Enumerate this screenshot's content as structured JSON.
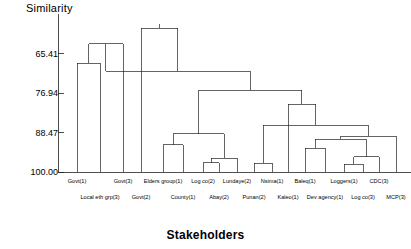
{
  "chart_data": {
    "type": "dendrogram",
    "title": "",
    "ylabel": "Similarity",
    "xlabel": "Stakeholders",
    "ytick_labels": [
      "65.41",
      "76.94",
      "88.47",
      "100.00"
    ],
    "ytick_values": [
      65.41,
      76.94,
      88.47,
      100.0
    ],
    "ylim": [
      100.0,
      53.88
    ],
    "axis_inverted": true,
    "grid": false,
    "legend": null,
    "leaves": [
      {
        "index": 0,
        "label": "Govt(1)",
        "row": 0,
        "x": 77
      },
      {
        "index": 1,
        "label": "Local eth grp(3)",
        "row": 1,
        "x": 100
      },
      {
        "index": 2,
        "label": "Govt(3)",
        "row": 0,
        "x": 123
      },
      {
        "index": 3,
        "label": "Govt(2)",
        "row": 1,
        "x": 141
      },
      {
        "index": 4,
        "label": "Elders group(1)",
        "row": 0,
        "x": 163
      },
      {
        "index": 5,
        "label": "County(1)",
        "row": 1,
        "x": 183
      },
      {
        "index": 6,
        "label": "Log co(2)",
        "row": 0,
        "x": 203
      },
      {
        "index": 7,
        "label": "Abay(2)",
        "row": 1,
        "x": 219
      },
      {
        "index": 8,
        "label": "Lundaye(2)",
        "row": 0,
        "x": 237
      },
      {
        "index": 9,
        "label": "Punan(2)",
        "row": 1,
        "x": 254
      },
      {
        "index": 10,
        "label": "Nsima(1)",
        "row": 0,
        "x": 272
      },
      {
        "index": 11,
        "label": "Kaleo(1)",
        "row": 1,
        "x": 288
      },
      {
        "index": 12,
        "label": "Baleq(1)",
        "row": 0,
        "x": 305
      },
      {
        "index": 13,
        "label": "Dev agency(1)",
        "row": 1,
        "x": 325
      },
      {
        "index": 14,
        "label": "Loggers(1)",
        "row": 0,
        "x": 344
      },
      {
        "index": 15,
        "label": "Log co(3)",
        "row": 1,
        "x": 363
      },
      {
        "index": 16,
        "label": "CDC(3)",
        "row": 0,
        "x": 379
      },
      {
        "index": 17,
        "label": "MCP(3)",
        "row": 1,
        "x": 396
      }
    ],
    "merges": [
      {
        "id": "m1",
        "left": 0,
        "right": 1,
        "similarity": 68.2
      },
      {
        "id": "m2",
        "left": "m1",
        "right": 2,
        "similarity": 62.5
      },
      {
        "id": "m3",
        "left": 6,
        "right": 7,
        "similarity": 97.3
      },
      {
        "id": "m4",
        "left": "m3",
        "right": 8,
        "similarity": 96.0
      },
      {
        "id": "m5",
        "left": 4,
        "right": 5,
        "similarity": 92.1
      },
      {
        "id": "m6",
        "left": "m5",
        "right": "m4",
        "similarity": 88.8
      },
      {
        "id": "m7",
        "left": 9,
        "right": 10,
        "similarity": 97.5
      },
      {
        "id": "m8",
        "left": 14,
        "right": 15,
        "similarity": 97.8
      },
      {
        "id": "m9",
        "left": "m8",
        "right": 16,
        "similarity": 95.5
      },
      {
        "id": "m10",
        "left": 12,
        "right": 13,
        "similarity": 93.0
      },
      {
        "id": "m11",
        "left": "m10",
        "right": "m9",
        "similarity": 90.5
      },
      {
        "id": "m12",
        "left": "m11",
        "right": 17,
        "similarity": 89.6
      },
      {
        "id": "m13",
        "left": "m7",
        "right": "m12",
        "similarity": 86.4
      },
      {
        "id": "m14",
        "left": 11,
        "right": "m13",
        "similarity": 80.2
      },
      {
        "id": "m15",
        "left": "m6",
        "right": "m14",
        "similarity": 76.2
      },
      {
        "id": "m16",
        "left": "m2",
        "right": "m15",
        "similarity": 70.6
      },
      {
        "id": "m17",
        "left": 3,
        "right": "m16",
        "similarity": 58.0
      }
    ]
  }
}
